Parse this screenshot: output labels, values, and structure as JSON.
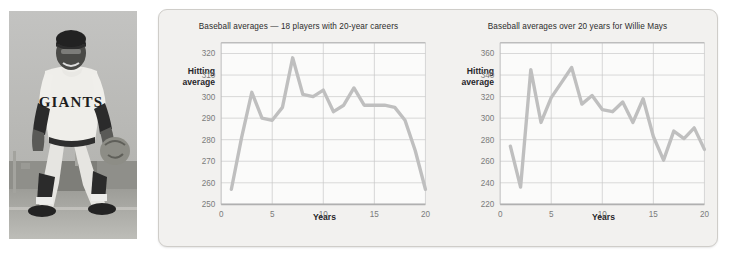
{
  "photo": {
    "alt_name": "baseball-player-photo",
    "jersey_text": "GIANTS",
    "palette": {
      "sky": "#b5b5b3",
      "ground": "#9a9a96",
      "uniform": "#e9e8e4",
      "dark": "#2a2a2a"
    }
  },
  "panel": {
    "background": "#f2f1ef",
    "border_color": "#cfcdc9"
  },
  "chart_data": [
    {
      "id": "left-chart",
      "type": "line",
      "title": "Baseball averages — 18 players with 20-year careers",
      "xlabel": "Years",
      "ylabel": "Hitting average",
      "ylabel_line1": "Hitting",
      "ylabel_line2": "average",
      "xlim": [
        0,
        20
      ],
      "ylim": [
        250,
        325
      ],
      "ytick_values": [
        250,
        260,
        270,
        280,
        290,
        300,
        310,
        320
      ],
      "ytick_labels": [
        "250",
        "260",
        "270",
        "280",
        "290",
        "300",
        "310",
        "320"
      ],
      "xtick_values": [
        0,
        5,
        10,
        15,
        20
      ],
      "xtick_labels": [
        "0",
        "5",
        "10",
        "15",
        "20"
      ],
      "grid": true,
      "line_color": "#bfbfbf",
      "x": [
        1,
        2,
        3,
        4,
        5,
        6,
        7,
        8,
        9,
        10,
        11,
        12,
        13,
        14,
        15,
        16,
        17,
        18,
        19,
        20
      ],
      "values": [
        257,
        281,
        302,
        290,
        289,
        295,
        318,
        301,
        300,
        303,
        293,
        296,
        304,
        296,
        296,
        296,
        295,
        289,
        275,
        257
      ]
    },
    {
      "id": "right-chart",
      "type": "line",
      "title": "Baseball averages over 20 years for Willie Mays",
      "xlabel": "Years",
      "ylabel": "Hitting average",
      "ylabel_line1": "Hitting",
      "ylabel_line2": "average",
      "xlim": [
        0,
        20
      ],
      "ylim": [
        220,
        370
      ],
      "ytick_values": [
        220,
        240,
        260,
        280,
        300,
        320,
        340,
        360
      ],
      "ytick_labels": [
        "220",
        "240",
        "260",
        "280",
        "300",
        "320",
        "340",
        "360"
      ],
      "xtick_values": [
        0,
        5,
        10,
        15,
        20
      ],
      "xtick_labels": [
        "0",
        "5",
        "10",
        "15",
        "20"
      ],
      "grid": true,
      "line_color": "#bfbfbf",
      "x": [
        1,
        2,
        3,
        4,
        5,
        6,
        7,
        8,
        9,
        10,
        11,
        12,
        13,
        14,
        15,
        16,
        17,
        18,
        19,
        20
      ],
      "values": [
        274,
        236,
        345,
        296,
        319,
        333,
        347,
        313,
        321,
        308,
        306,
        315,
        296,
        318,
        283,
        261,
        288,
        281,
        291,
        271
      ]
    }
  ]
}
